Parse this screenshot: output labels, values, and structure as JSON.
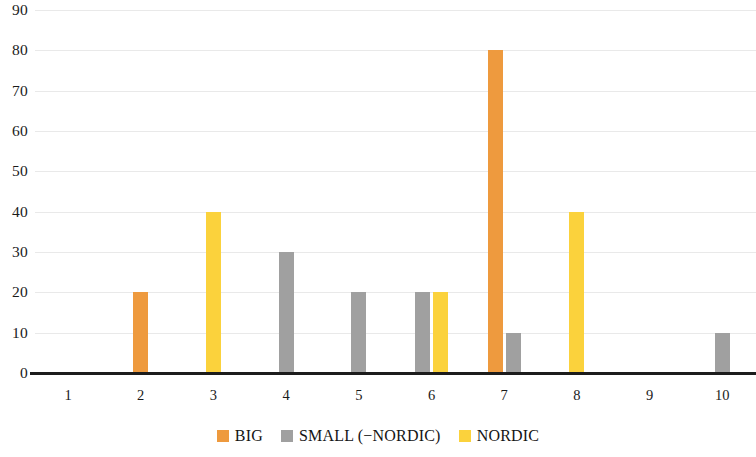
{
  "chart_data": {
    "type": "bar",
    "title": "",
    "subtitle": "",
    "xlabel": "",
    "ylabel": "",
    "categories": [
      "1",
      "2",
      "3",
      "4",
      "5",
      "6",
      "7",
      "8",
      "9",
      "10"
    ],
    "series": [
      {
        "name": "BIG",
        "color": "#ee9a3e",
        "values": [
          0,
          20,
          0,
          0,
          0,
          0,
          80,
          0,
          0,
          0
        ]
      },
      {
        "name": "SMALL (−NORDIC)",
        "color": "#a0a0a0",
        "values": [
          0,
          0,
          0,
          30,
          20,
          20,
          10,
          0,
          0,
          10
        ]
      },
      {
        "name": "NORDIC",
        "color": "#fbd23c",
        "values": [
          0,
          0,
          40,
          0,
          0,
          20,
          0,
          40,
          0,
          0
        ]
      }
    ],
    "ylim": [
      0,
      90
    ],
    "yticks": [
      "0",
      "10",
      "20",
      "30",
      "40",
      "50",
      "60",
      "70",
      "80",
      "90"
    ],
    "ytick_values": [
      0,
      10,
      20,
      30,
      40,
      50,
      60,
      70,
      80,
      90
    ],
    "grid": true,
    "legend_position": "bottom"
  },
  "legend": {
    "entries": [
      {
        "label": "BIG",
        "color": "#ee9a3e"
      },
      {
        "label": "SMALL (−NORDIC)",
        "color": "#a0a0a0"
      },
      {
        "label": "NORDIC",
        "color": "#fbd23c"
      }
    ]
  }
}
